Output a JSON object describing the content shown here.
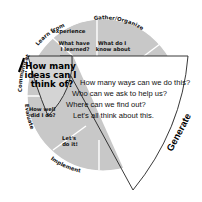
{
  "diagram": {
    "center_idea": {
      "question_lines": [
        "How many",
        "ideas can I",
        "think of?"
      ]
    },
    "segments": [
      {
        "stage": "Learn from experience",
        "stage_lines": [
          "Learn from",
          "experience"
        ],
        "question_lines": [
          "What have",
          "I learned?"
        ]
      },
      {
        "stage": "Gather/Organize",
        "stage_lines": [
          "Gather/Organize"
        ],
        "question_lines": [
          "What do I",
          "know about"
        ]
      },
      {
        "stage": "Communicate",
        "stage_lines": [
          "Communicate"
        ],
        "question_lines": []
      },
      {
        "stage": "Evaluate",
        "stage_lines": [
          "Evaluate"
        ],
        "question_lines": [
          "How well",
          "did I do?"
        ]
      },
      {
        "stage": "Implement",
        "stage_lines": [
          "Implement"
        ],
        "question_lines": [
          "Let's",
          "do it!"
        ]
      }
    ],
    "generate": {
      "label": "Generate",
      "lines": [
        "How many ways can we do this?",
        "Who can we ask to help us?",
        "Where can we find out?",
        "Let's all think about this."
      ]
    },
    "colors": {
      "segment_fill": "#c8c8c8",
      "divider": "#ffffff",
      "outline": "#222222"
    }
  }
}
